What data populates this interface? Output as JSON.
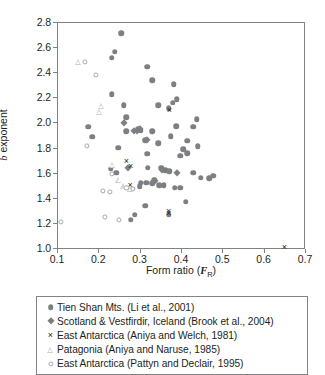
{
  "chart_data": {
    "type": "scatter",
    "title": "",
    "xlabel": "Form ratio (F_R)",
    "xlabel_parts": {
      "prefix": "Form ratio (",
      "italic": "F",
      "sub": "R",
      "suffix": ")"
    },
    "ylabel": "b exponent",
    "ylabel_parts": {
      "italic": "b",
      "rest": " exponent"
    },
    "xlim": [
      0.1,
      0.7
    ],
    "ylim": [
      1.0,
      2.8
    ],
    "xticks": [
      "0.1",
      "0.2",
      "0.3",
      "0.4",
      "0.5",
      "0.6",
      "0.7"
    ],
    "xtick_values": [
      0.1,
      0.2,
      0.3,
      0.4,
      0.5,
      0.6,
      0.7
    ],
    "yticks": [
      "1.0",
      "1.2",
      "1.4",
      "1.6",
      "1.8",
      "2.0",
      "2.2",
      "2.4",
      "2.6",
      "2.8"
    ],
    "ytick_values": [
      1.0,
      1.2,
      1.4,
      1.6,
      1.8,
      2.0,
      2.2,
      2.4,
      2.6,
      2.8
    ],
    "grid": false,
    "legend_position": "below",
    "marker_color_filled": "#7d7f83",
    "marker_color_open": "#a7a9ac",
    "marker_color_light": "#cdcfd1",
    "cross_color": "#231f20",
    "axis_color": "#808285",
    "series": [
      {
        "name": "Tien Shan Mts. (Li et al., 2001)",
        "marker": "circle-filled",
        "points": [
          [
            0.255,
            2.71
          ],
          [
            0.24,
            2.565
          ],
          [
            0.233,
            2.515
          ],
          [
            0.233,
            2.225
          ],
          [
            0.318,
            2.445
          ],
          [
            0.33,
            2.335
          ],
          [
            0.383,
            2.305
          ],
          [
            0.39,
            2.185
          ],
          [
            0.38,
            2.155
          ],
          [
            0.262,
            2.135
          ],
          [
            0.345,
            2.135
          ],
          [
            0.37,
            2.115
          ],
          [
            0.268,
            2.04
          ],
          [
            0.438,
            2.025
          ],
          [
            0.175,
            1.965
          ],
          [
            0.388,
            1.97
          ],
          [
            0.43,
            1.965
          ],
          [
            0.297,
            1.945
          ],
          [
            0.303,
            1.935
          ],
          [
            0.268,
            1.93
          ],
          [
            0.185,
            1.885
          ],
          [
            0.375,
            1.89
          ],
          [
            0.33,
            1.93
          ],
          [
            0.313,
            1.86
          ],
          [
            0.345,
            1.835
          ],
          [
            0.415,
            1.855
          ],
          [
            0.44,
            1.81
          ],
          [
            0.248,
            1.8
          ],
          [
            0.405,
            1.785
          ],
          [
            0.415,
            1.755
          ],
          [
            0.398,
            1.735
          ],
          [
            0.318,
            1.75
          ],
          [
            0.32,
            1.64
          ],
          [
            0.23,
            1.63
          ],
          [
            0.243,
            1.6
          ],
          [
            0.352,
            1.64
          ],
          [
            0.362,
            1.62
          ],
          [
            0.372,
            1.61
          ],
          [
            0.43,
            1.6
          ],
          [
            0.448,
            1.56
          ],
          [
            0.468,
            1.555
          ],
          [
            0.478,
            1.575
          ],
          [
            0.335,
            1.545
          ],
          [
            0.303,
            1.52
          ],
          [
            0.316,
            1.52
          ],
          [
            0.33,
            1.515
          ],
          [
            0.347,
            1.5
          ],
          [
            0.358,
            1.5
          ],
          [
            0.3,
            1.49
          ],
          [
            0.385,
            1.48
          ],
          [
            0.398,
            1.48
          ],
          [
            0.412,
            1.37
          ],
          [
            0.313,
            1.335
          ],
          [
            0.37,
            1.265
          ],
          [
            0.288,
            1.265
          ],
          [
            0.278,
            1.225
          ]
        ]
      },
      {
        "name": "Scotland & Vestfirdir, Iceland (Brook et al., 2004)",
        "marker": "diamond-filled",
        "points": [
          [
            0.262,
            1.995
          ],
          [
            0.3,
            1.95
          ],
          [
            0.293,
            1.93
          ],
          [
            0.287,
            1.93
          ],
          [
            0.318,
            1.86
          ],
          [
            0.272,
            1.64
          ],
          [
            0.355,
            1.62
          ],
          [
            0.39,
            1.595
          ],
          [
            0.338,
            1.535
          ]
        ]
      },
      {
        "name": "East Antarctica (Aniya and Welch, 1981)",
        "marker": "cross",
        "points": [
          [
            0.372,
            2.1
          ],
          [
            0.268,
            1.69
          ],
          [
            0.278,
            1.65
          ],
          [
            0.277,
            1.505
          ],
          [
            0.37,
            1.295
          ],
          [
            0.37,
            1.275
          ],
          [
            0.65,
            1.01
          ]
        ]
      },
      {
        "name": "Patagonia (Aniya and Naruse, 1985)",
        "marker": "triangle-open",
        "points": [
          [
            0.152,
            2.48
          ],
          [
            0.208,
            2.13
          ],
          [
            0.203,
            2.085
          ],
          [
            0.234,
            1.665
          ],
          [
            0.25,
            1.545
          ],
          [
            0.262,
            1.49
          ],
          [
            0.278,
            1.47
          ]
        ]
      },
      {
        "name": "East Antarctica (Pattyn and Declair, 1995)",
        "marker": "circle-open",
        "points": [
          [
            0.168,
            2.48
          ],
          [
            0.195,
            2.38
          ],
          [
            0.172,
            1.81
          ],
          [
            0.232,
            1.59
          ],
          [
            0.268,
            1.48
          ],
          [
            0.283,
            1.47
          ],
          [
            0.228,
            1.45
          ],
          [
            0.212,
            1.455
          ],
          [
            0.215,
            1.245
          ],
          [
            0.25,
            1.225
          ],
          [
            0.11,
            1.21
          ]
        ]
      }
    ]
  },
  "legend": {
    "items": [
      {
        "marker": "circle-filled",
        "label": "Tien Shan Mts. (Li et al., 2001)"
      },
      {
        "marker": "diamond-filled",
        "label": "Scotland & Vestfirdir, Iceland (Brook et al., 2004)"
      },
      {
        "marker": "cross",
        "label": "East Antarctica (Aniya and Welch, 1981)"
      },
      {
        "marker": "triangle-open",
        "label": "Patagonia (Aniya and Naruse, 1985)"
      },
      {
        "marker": "circle-open",
        "label": "East Antarctica (Pattyn and Declair, 1995)"
      }
    ]
  },
  "icons": {
    "cross_glyph": "×"
  }
}
